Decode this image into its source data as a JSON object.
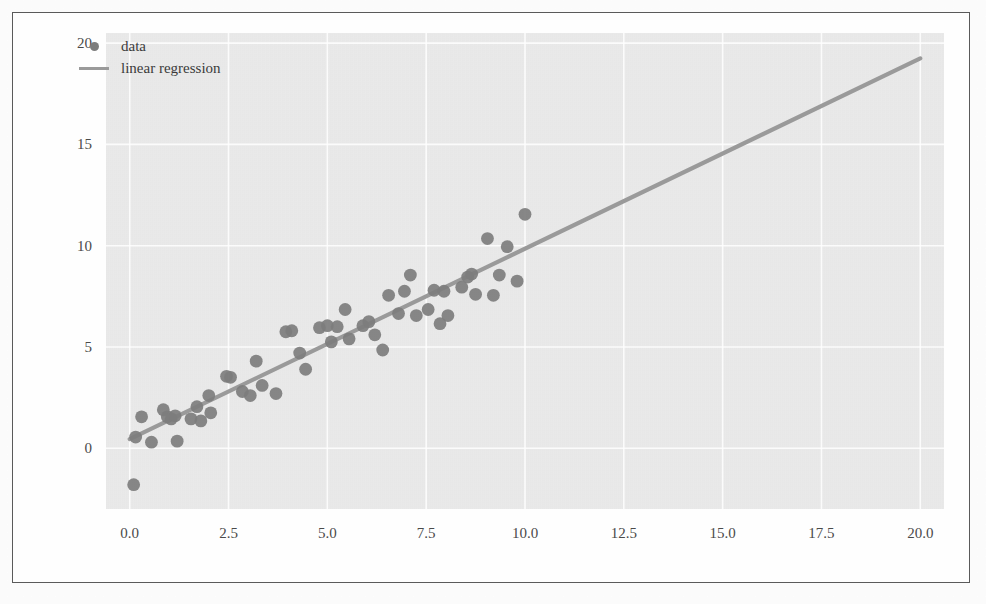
{
  "figure": {
    "marker_color": "#7d7d7d",
    "line_color": "#9a9a9a",
    "plot_bg": "#ebebeb",
    "frame_color": "#5a5a5a"
  },
  "legend": {
    "position": "upper-left",
    "entries": [
      {
        "label": "data",
        "symbol": "filled-circle-marker"
      },
      {
        "label": "linear regression",
        "symbol": "solid-line"
      }
    ]
  },
  "axes": {
    "xticks": [
      "0.0",
      "2.5",
      "5.0",
      "7.5",
      "10.0",
      "12.5",
      "15.0",
      "17.5",
      "20.0"
    ],
    "yticks": [
      "0",
      "5",
      "10",
      "15",
      "20"
    ],
    "xlabel": "",
    "ylabel": ""
  },
  "chart_data": {
    "type": "scatter",
    "title": "",
    "xlabel": "",
    "ylabel": "",
    "xlim": [
      -0.6,
      20.6
    ],
    "ylim": [
      -3.0,
      20.5
    ],
    "xticks": [
      0.0,
      2.5,
      5.0,
      7.5,
      10.0,
      12.5,
      15.0,
      17.5,
      20.0
    ],
    "yticks": [
      0,
      5,
      10,
      15,
      20
    ],
    "grid": true,
    "legend_position": "upper left",
    "series": [
      {
        "name": "data",
        "type": "scatter",
        "marker": "o",
        "color": "#7d7d7d",
        "points": [
          [
            0.1,
            -1.8
          ],
          [
            0.15,
            0.55
          ],
          [
            0.3,
            1.55
          ],
          [
            0.55,
            0.3
          ],
          [
            0.85,
            1.9
          ],
          [
            0.95,
            1.55
          ],
          [
            1.05,
            1.45
          ],
          [
            1.15,
            1.6
          ],
          [
            1.2,
            0.35
          ],
          [
            1.55,
            1.45
          ],
          [
            1.7,
            2.05
          ],
          [
            1.8,
            1.35
          ],
          [
            2.0,
            2.6
          ],
          [
            2.05,
            1.75
          ],
          [
            2.45,
            3.55
          ],
          [
            2.55,
            3.5
          ],
          [
            2.85,
            2.8
          ],
          [
            3.05,
            2.6
          ],
          [
            3.2,
            4.3
          ],
          [
            3.35,
            3.1
          ],
          [
            3.7,
            2.7
          ],
          [
            3.95,
            5.75
          ],
          [
            4.1,
            5.8
          ],
          [
            4.3,
            4.7
          ],
          [
            4.45,
            3.9
          ],
          [
            4.8,
            5.95
          ],
          [
            5.0,
            6.05
          ],
          [
            5.1,
            5.25
          ],
          [
            5.25,
            6.0
          ],
          [
            5.45,
            6.85
          ],
          [
            5.55,
            5.4
          ],
          [
            5.9,
            6.05
          ],
          [
            6.05,
            6.25
          ],
          [
            6.2,
            5.6
          ],
          [
            6.4,
            4.85
          ],
          [
            6.55,
            7.55
          ],
          [
            6.8,
            6.65
          ],
          [
            6.95,
            7.75
          ],
          [
            7.1,
            8.55
          ],
          [
            7.25,
            6.55
          ],
          [
            7.55,
            6.85
          ],
          [
            7.7,
            7.8
          ],
          [
            7.85,
            6.15
          ],
          [
            7.95,
            7.75
          ],
          [
            8.05,
            6.55
          ],
          [
            8.4,
            7.95
          ],
          [
            8.55,
            8.45
          ],
          [
            8.65,
            8.6
          ],
          [
            8.75,
            7.6
          ],
          [
            9.05,
            10.35
          ],
          [
            9.2,
            7.55
          ],
          [
            9.35,
            8.55
          ],
          [
            9.55,
            9.95
          ],
          [
            9.8,
            8.25
          ],
          [
            10.0,
            11.55
          ]
        ]
      },
      {
        "name": "linear regression",
        "type": "line",
        "color": "#9a9a9a",
        "slope": 0.94,
        "intercept": 0.45,
        "x": [
          0.0,
          20.0
        ],
        "y": [
          0.45,
          19.25
        ]
      }
    ]
  }
}
